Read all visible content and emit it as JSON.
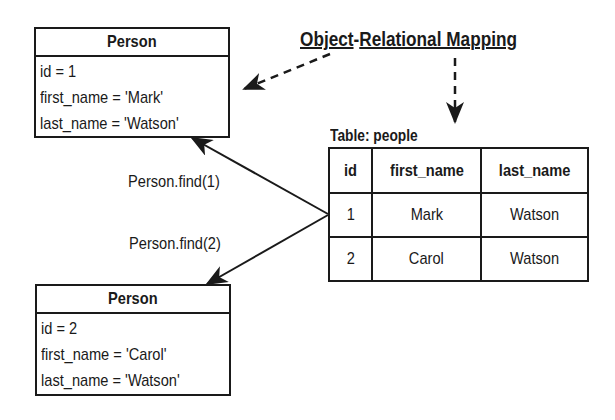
{
  "title": {
    "part1": "Object",
    "separator": "-",
    "part2": "Relational Mapping"
  },
  "objects": [
    {
      "class_name": "Person",
      "attributes": [
        "id = 1",
        "first_name = 'Mark'",
        "last_name = 'Watson'"
      ]
    },
    {
      "class_name": "Person",
      "attributes": [
        "id = 2",
        "first_name = 'Carol'",
        "last_name = 'Watson'"
      ]
    }
  ],
  "table": {
    "caption": "Table: people",
    "columns": [
      "id",
      "first_name",
      "last_name"
    ],
    "rows": [
      [
        "1",
        "Mark",
        "Watson"
      ],
      [
        "2",
        "Carol",
        "Watson"
      ]
    ]
  },
  "calls": [
    {
      "label": "Person.find(1)"
    },
    {
      "label": "Person.find(2)"
    }
  ],
  "colors": {
    "stroke": "#1a1a1a",
    "background": "#ffffff"
  }
}
